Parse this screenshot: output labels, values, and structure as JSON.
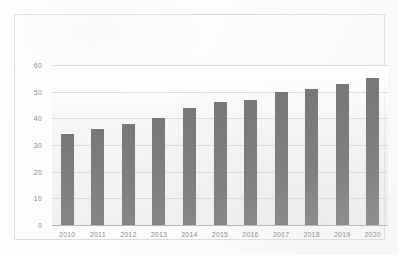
{
  "chart_data": {
    "type": "bar",
    "title": "",
    "subtitle": "",
    "xlabel": "",
    "ylabel": "",
    "categories": [
      "2010",
      "2011",
      "2012",
      "2013",
      "2014",
      "2015",
      "2016",
      "2017",
      "2018",
      "2019",
      "2020"
    ],
    "values": [
      34,
      36,
      38,
      40,
      44,
      46,
      47,
      50,
      51,
      53,
      55
    ],
    "series": [
      {
        "name": "",
        "values": [
          34,
          36,
          38,
          40,
          44,
          46,
          47,
          50,
          51,
          53,
          55
        ]
      }
    ],
    "ylim": [
      0,
      60
    ],
    "ytick_labels": [
      "0",
      "10",
      "20",
      "30",
      "40",
      "50",
      "60"
    ],
    "ytick_values": [
      0,
      10,
      20,
      30,
      40,
      50,
      60
    ],
    "grid": true,
    "legend": false,
    "legend_position": "none",
    "annotations": [],
    "bar_color": "#7d7d7b",
    "gridline_color": "#d6d6d4",
    "axis_text_color": "#8a8a88",
    "frame_color": "#dcdcda",
    "background_color": "#ffffff"
  }
}
